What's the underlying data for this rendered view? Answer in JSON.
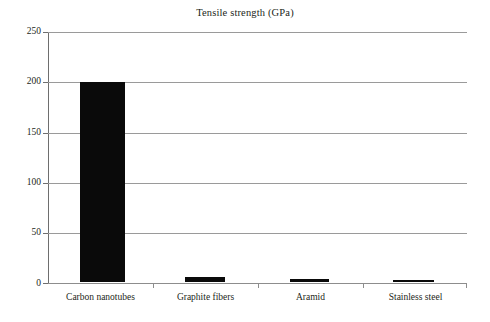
{
  "chart_data": {
    "type": "bar",
    "title": "Tensile strength (GPa)",
    "xlabel": "",
    "ylabel": "",
    "categories": [
      "Carbon nanotubes",
      "Graphite fibers",
      "Aramid",
      "Stainless steel"
    ],
    "values": [
      200,
      5,
      3,
      1.5
    ],
    "series": [
      {
        "name": "Tensile strength (GPa)",
        "values": [
          200,
          5,
          3,
          1.5
        ]
      }
    ],
    "ylim": [
      0,
      250
    ],
    "yticks": [
      0,
      50,
      100,
      150,
      200,
      250
    ],
    "ytick_labels": [
      "0",
      "50",
      "100",
      "150",
      "200",
      "250"
    ],
    "grid": true,
    "grid_axis": "y",
    "legend": false,
    "legend_position": "none",
    "bar_color": "#0a0a0a",
    "gridline_color": "#9a9a9a",
    "axis_color": "#6e6e6e",
    "background_color": "#ffffff",
    "text_color": "#231f20"
  }
}
